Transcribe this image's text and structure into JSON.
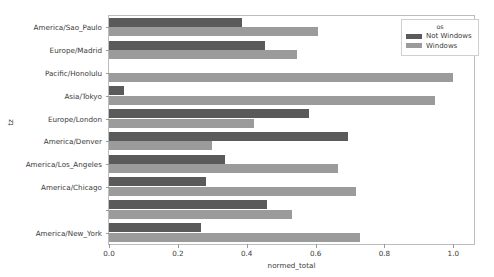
{
  "chart_data": {
    "type": "bar",
    "orientation": "horizontal",
    "title": "",
    "xlabel": "normed_total",
    "ylabel": "tz",
    "xlim": [
      0.0,
      1.06
    ],
    "xticks": [
      0.0,
      0.2,
      0.4,
      0.6,
      0.8,
      1.0
    ],
    "xticklabels": [
      "0.0",
      "0.2",
      "0.4",
      "0.6",
      "0.8",
      "1.0"
    ],
    "grid": false,
    "categories": [
      "America/Sao_Paulo",
      "Europe/Madrid",
      "Pacific/Honolulu",
      "Asia/Tokyo",
      "Europe/London",
      "America/Denver",
      "America/Los_Angeles",
      "America/Chicago",
      "",
      "America/New_York"
    ],
    "ytick_labels_visible": [
      "America/Sao_Paulo",
      "Europe/Madrid",
      "Pacific/Honolulu",
      "Asia/Tokyo",
      "Europe/London",
      "America/Denver",
      "America/Los_Angeles",
      "America/Chicago",
      "",
      "America/New_York"
    ],
    "series": [
      {
        "name": "Not Windows",
        "color": "#5a5a5a",
        "values": [
          0.385,
          0.452,
          0.0,
          0.045,
          0.58,
          0.695,
          0.337,
          0.282,
          0.46,
          0.267
        ]
      },
      {
        "name": "Windows",
        "color": "#9b9b9b",
        "values": [
          0.607,
          0.546,
          1.0,
          0.947,
          0.42,
          0.3,
          0.664,
          0.716,
          0.532,
          0.73
        ]
      }
    ],
    "legend": {
      "title": "os",
      "position": "upper right",
      "entries": [
        {
          "label": "Not Windows",
          "color": "#5a5a5a"
        },
        {
          "label": "Windows",
          "color": "#9b9b9b"
        }
      ]
    }
  }
}
